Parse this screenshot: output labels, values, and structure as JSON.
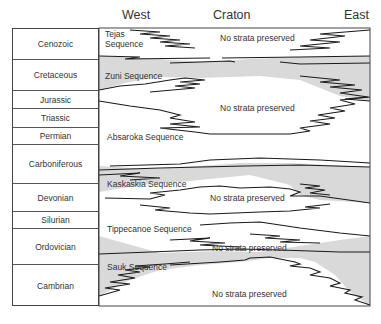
{
  "headers": {
    "west": "West",
    "craton": "Craton",
    "east": "East"
  },
  "periods": [
    {
      "name": "Cenozoic",
      "top": 0,
      "height": 30
    },
    {
      "name": "Cretaceous",
      "top": 30,
      "height": 31
    },
    {
      "name": "Jurassic",
      "top": 61,
      "height": 18
    },
    {
      "name": "Triassic",
      "top": 79,
      "height": 19
    },
    {
      "name": "Permian",
      "top": 98,
      "height": 17
    },
    {
      "name": "Carboniferous",
      "top": 115,
      "height": 39
    },
    {
      "name": "Devonian",
      "top": 154,
      "height": 28
    },
    {
      "name": "Silurian",
      "top": 182,
      "height": 17
    },
    {
      "name": "Ordovician",
      "top": 199,
      "height": 36
    },
    {
      "name": "Cambrian",
      "top": 235,
      "height": 43
    }
  ],
  "sequences": {
    "tejas_line1": "Tejas",
    "tejas_line2": "Sequence",
    "zuni": "Zuni Sequence",
    "absaroka": "Absaroka Sequence",
    "kaskaskia": "Kaskaskia Sequence",
    "tippecanoe": "Tippecanoe Sequence",
    "sauk": "Sauk Sequence"
  },
  "hiatus_labels": {
    "cenozoic": "No strata preserved",
    "jurassic_triassic": "No strata preserved",
    "devonian": "No strata preserved",
    "ordovician": "No strata preserved",
    "cambrian": "No strata preserved"
  },
  "colors": {
    "shaded_sequence": "#d9d9d9",
    "line": "#1a1a1a",
    "border": "#444444"
  }
}
